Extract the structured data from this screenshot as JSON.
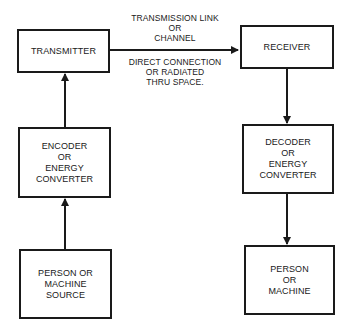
{
  "diagram": {
    "type": "block-flow",
    "nodes": [
      {
        "id": "transmitter",
        "label": "TRANSMITTER"
      },
      {
        "id": "encoder",
        "label": "ENCODER\nOR\nENERGY\nCONVERTER"
      },
      {
        "id": "source",
        "label": "PERSON OR\nMACHINE\nSOURCE"
      },
      {
        "id": "receiver",
        "label": "RECEIVER"
      },
      {
        "id": "decoder",
        "label": "DECODER\nOR\nENERGY\nCONVERTER"
      },
      {
        "id": "destination",
        "label": "PERSON\nOR\nMACHINE"
      }
    ],
    "edges": [
      {
        "from": "source",
        "to": "encoder"
      },
      {
        "from": "encoder",
        "to": "transmitter"
      },
      {
        "from": "transmitter",
        "to": "receiver"
      },
      {
        "from": "receiver",
        "to": "decoder"
      },
      {
        "from": "decoder",
        "to": "destination"
      }
    ],
    "link_label_above": "TRANSMISSION LINK\nOR\nCHANNEL",
    "link_label_below": "DIRECT CONNECTION\nOR RADIATED\nTHRU SPACE.",
    "line_color": "#1a1a1a"
  }
}
